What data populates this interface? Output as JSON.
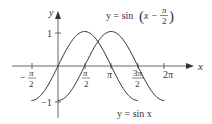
{
  "chart_data": {
    "type": "line",
    "title": "",
    "xlabel": "x",
    "ylabel": "y",
    "xlim": [
      -1.7,
      7.0
    ],
    "ylim": [
      -1.2,
      1.3
    ],
    "grid": false,
    "x_ticks": [
      {
        "value": -1.5708,
        "label": "-π/2"
      },
      {
        "value": 1.5708,
        "label": "π/2"
      },
      {
        "value": 3.1416,
        "label": "π"
      },
      {
        "value": 4.7124,
        "label": "3π/2"
      },
      {
        "value": 6.2832,
        "label": "2π"
      }
    ],
    "y_ticks": [
      {
        "value": 1,
        "label": "1"
      },
      {
        "value": -1,
        "label": "-1"
      }
    ],
    "series": [
      {
        "name": "y = sin x",
        "domain": [
          -1.5708,
          4.7124
        ],
        "x": [
          -1.5708,
          0,
          1.5708,
          3.1416,
          4.7124
        ],
        "values": [
          -1,
          0,
          1,
          0,
          -1
        ]
      },
      {
        "name": "y = sin(x − π/2)",
        "domain": [
          0,
          6.2832
        ],
        "x": [
          0,
          1.5708,
          3.1416,
          4.7124,
          6.2832
        ],
        "values": [
          -1,
          0,
          1,
          0,
          -1
        ]
      }
    ],
    "annotations": [
      {
        "text": "y = sin(x − π/2)",
        "position": "top-right"
      },
      {
        "text": "y = sin x",
        "position": "bottom-right"
      }
    ]
  },
  "labels": {
    "x_axis": "x",
    "y_axis": "y",
    "y_tick_pos": "1",
    "y_tick_neg": "−1",
    "x_tick_neg_half_pi_num": "π",
    "x_tick_neg_half_pi_den": "2",
    "x_tick_neg_sign": "−",
    "x_tick_half_pi_num": "π",
    "x_tick_half_pi_den": "2",
    "x_tick_pi": "π",
    "x_tick_three_half_pi_num": "3π",
    "x_tick_three_half_pi_den": "2",
    "x_tick_two_pi": "2π",
    "shifted_prefix": "y = sin",
    "shifted_arg_x": "x −",
    "shifted_num": "π",
    "shifted_den": "2",
    "sin_label": "y = sin x"
  },
  "colors": {
    "curve": "#333333",
    "axis": "#555555"
  }
}
